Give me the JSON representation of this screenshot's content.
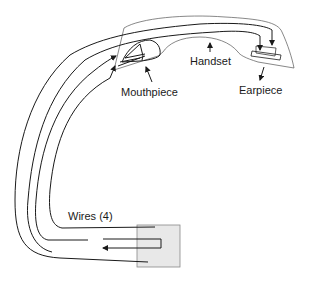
{
  "diagram": {
    "type": "telephone handset wiring",
    "labels": {
      "handset": "Handset",
      "mouthpiece": "Mouthpiece",
      "earpiece": "Earpiece",
      "wires": "Wires (4)"
    },
    "colors": {
      "line": "#1a1a1a",
      "outline": "#555555",
      "junction_box_fill": "#e8e8e8",
      "junction_box_stroke": "#888888"
    }
  }
}
